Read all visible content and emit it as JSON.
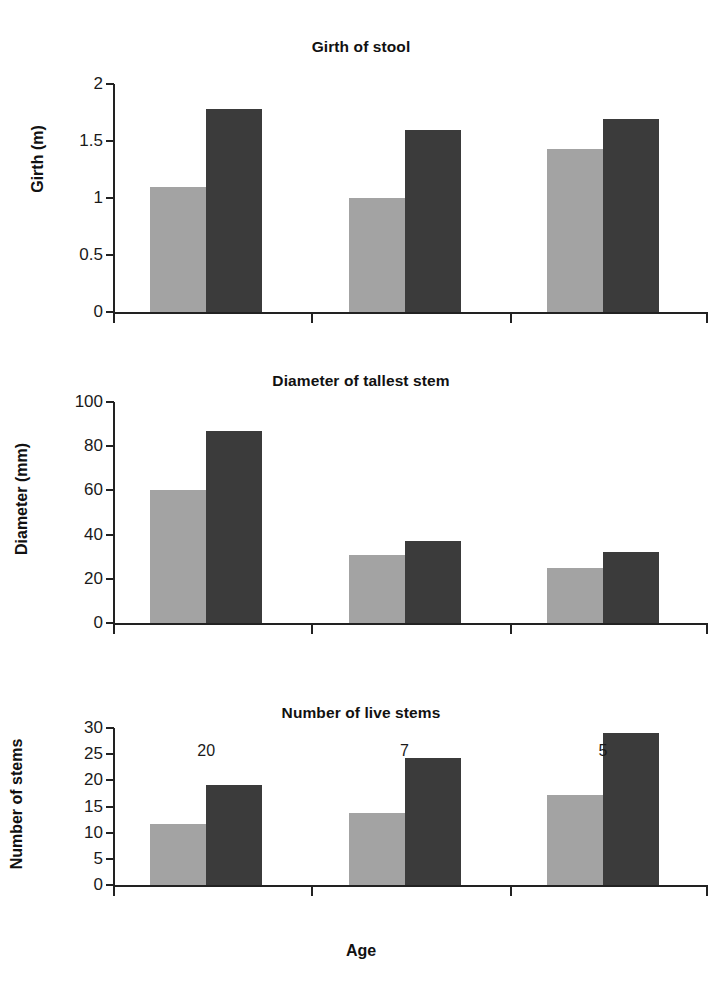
{
  "figure": {
    "background": "#ffffff",
    "series_colors": {
      "light": "#a3a3a3",
      "dark": "#3b3b3b"
    },
    "axis_color": "#222222",
    "xlabel": "Age"
  },
  "chart_data": [
    {
      "type": "bar",
      "title": "Girth of stool",
      "xlabel": "",
      "ylabel": "Girth (m)",
      "categories": [
        "20",
        "7",
        "5"
      ],
      "series": [
        {
          "name": "light",
          "color": "#a3a3a3",
          "values": [
            1.1,
            1.0,
            1.43
          ]
        },
        {
          "name": "dark",
          "color": "#3b3b3b",
          "values": [
            1.78,
            1.6,
            1.69
          ]
        }
      ],
      "ylim": [
        0,
        2
      ],
      "yticks": [
        0,
        0.5,
        1,
        1.5,
        2
      ],
      "ytick_labels": [
        "0",
        "0.5",
        "1",
        "1.5",
        "2"
      ],
      "grid": false,
      "legend": "none"
    },
    {
      "type": "bar",
      "title": "Diameter of tallest stem",
      "xlabel": "",
      "ylabel": "Diameter (mm)",
      "categories": [
        "20",
        "7",
        "5"
      ],
      "series": [
        {
          "name": "light",
          "color": "#a3a3a3",
          "values": [
            60,
            31,
            25
          ]
        },
        {
          "name": "dark",
          "color": "#3b3b3b",
          "values": [
            87,
            37,
            32
          ]
        }
      ],
      "ylim": [
        0,
        100
      ],
      "yticks": [
        0,
        20,
        40,
        60,
        80,
        100
      ],
      "ytick_labels": [
        "0",
        "20",
        "40",
        "60",
        "80",
        "100"
      ],
      "grid": false,
      "legend": "none"
    },
    {
      "type": "bar",
      "title": "Number of live stems",
      "xlabel": "Age",
      "ylabel": "Number of stems",
      "categories": [
        "20",
        "7",
        "5"
      ],
      "series": [
        {
          "name": "light",
          "color": "#a3a3a3",
          "values": [
            11.7,
            13.7,
            17.2
          ]
        },
        {
          "name": "dark",
          "color": "#3b3b3b",
          "values": [
            19.2,
            24.3,
            29.1
          ]
        }
      ],
      "ylim": [
        0,
        30
      ],
      "yticks": [
        0,
        5,
        10,
        15,
        20,
        25,
        30
      ],
      "ytick_labels": [
        "0",
        "5",
        "10",
        "15",
        "20",
        "25",
        "30"
      ],
      "grid": false,
      "legend": "none"
    }
  ]
}
